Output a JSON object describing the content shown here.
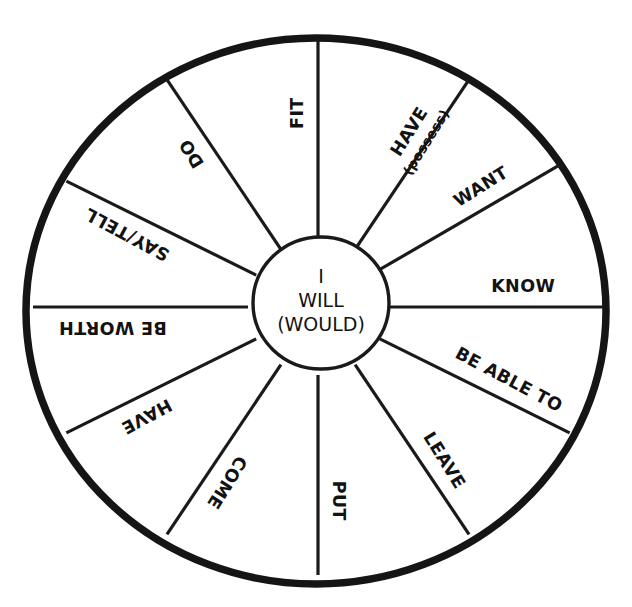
{
  "diagram": {
    "background_color": "#ffffff",
    "stroke_color": "#1a1a1a",
    "rim_color": "#151515",
    "hub": {
      "line1": "I",
      "line2": "WILL",
      "line3": "(WOULD)"
    },
    "sectors": [
      {
        "id": "fit",
        "label": "FIT",
        "sublabel": "",
        "spoke_angle_deg": 270,
        "label_angle_deg": 270
      },
      {
        "id": "have-possess",
        "label": "HAVE",
        "sublabel": "(possess)",
        "spoke_angle_deg": 302,
        "label_angle_deg": 302
      },
      {
        "id": "want",
        "label": "WANT",
        "sublabel": "",
        "spoke_angle_deg": 328,
        "label_angle_deg": 328
      },
      {
        "id": "know",
        "label": "KNOW",
        "sublabel": "",
        "spoke_angle_deg": 0,
        "label_angle_deg": 0
      },
      {
        "id": "be-able-to",
        "label": "BE ABLE TO",
        "sublabel": "",
        "spoke_angle_deg": 28,
        "label_angle_deg": 28
      },
      {
        "id": "leave",
        "label": "LEAVE",
        "sublabel": "",
        "spoke_angle_deg": 58,
        "label_angle_deg": 58
      },
      {
        "id": "put",
        "label": "PUT",
        "sublabel": "",
        "spoke_angle_deg": 90,
        "label_angle_deg": 90
      },
      {
        "id": "come",
        "label": "COME",
        "sublabel": "",
        "spoke_angle_deg": 122,
        "label_angle_deg": 122
      },
      {
        "id": "have-2",
        "label": "HAVE",
        "sublabel": "",
        "spoke_angle_deg": 152,
        "label_angle_deg": 152
      },
      {
        "id": "be-worth",
        "label": "BE WORTH",
        "sublabel": "",
        "spoke_angle_deg": 180,
        "label_angle_deg": 180
      },
      {
        "id": "say-tell",
        "label": "SAY/TELL",
        "sublabel": "",
        "spoke_angle_deg": 208,
        "label_angle_deg": 208
      },
      {
        "id": "do",
        "label": "DO",
        "sublabel": "",
        "spoke_angle_deg": 238,
        "label_angle_deg": 238
      }
    ]
  }
}
